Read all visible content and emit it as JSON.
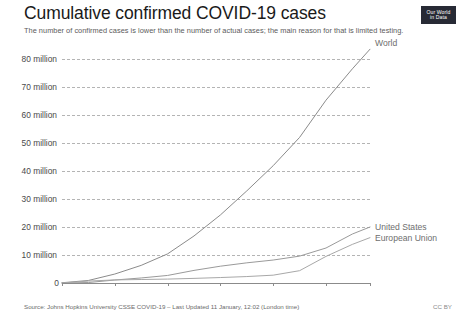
{
  "header": {
    "title": "Cumulative confirmed COVID-19 cases",
    "subtitle": "The number of confirmed cases is lower than the number of actual cases; the main reason for that is limited testing.",
    "logo_line1": "Our World",
    "logo_line2": "in Data"
  },
  "footer": {
    "source": "Source: Johns Hopkins University CSSE COVID-19 – Last Updated 11 January, 12:02  (London time)",
    "license": "CC BY"
  },
  "colors": {
    "world": "#8b8b8b",
    "united_states": "#9a9a9a",
    "european_union": "#a8a8a8",
    "grid": "#b4b4b4",
    "axis": "#8b8b8b",
    "logo_bg": "#272a35"
  },
  "chart_data": {
    "type": "line",
    "title": "Cumulative confirmed COVID-19 cases",
    "subtitle": "The number of confirmed cases is lower than the number of actual cases; the main reason for that is limited testing.",
    "xlabel": "",
    "ylabel": "",
    "grid": true,
    "legend": "inline-right",
    "ylim": [
      0,
      85000000
    ],
    "ytick_values": [
      10000000,
      20000000,
      30000000,
      40000000,
      50000000,
      60000000,
      70000000,
      80000000
    ],
    "ytick_labels": [
      "10 million",
      "20 million",
      "30 million",
      "40 million",
      "50 million",
      "60 million",
      "70 million",
      "80 million"
    ],
    "zero_label": "0",
    "xtick_labels": [
      "Mar 1, 2020",
      "Apr 30",
      "Jun 19",
      "Aug 8",
      "Sep 27",
      "Nov 16",
      "Dec 31, 2020"
    ],
    "xtick_positions": [
      0,
      60,
      120,
      180,
      240,
      300,
      350
    ],
    "xlim": [
      "Mar 1, 2020",
      "Dec 31, 2020"
    ],
    "series": [
      {
        "name": "World",
        "color": "#8b8b8b",
        "x": [
          0,
          30,
          60,
          90,
          120,
          150,
          180,
          210,
          240,
          270,
          300,
          330,
          350
        ],
        "values": [
          88000,
          900000,
          3200000,
          6300000,
          10400000,
          16800000,
          24300000,
          32900000,
          41900000,
          52000000,
          65300000,
          76500000,
          83500000
        ]
      },
      {
        "name": "United States",
        "color": "#9a9a9a",
        "x": [
          0,
          30,
          60,
          90,
          120,
          150,
          180,
          210,
          240,
          270,
          300,
          330,
          350
        ],
        "values": [
          75,
          164000,
          1070000,
          1800000,
          2700000,
          4500000,
          6000000,
          7200000,
          8200000,
          9600000,
          12500000,
          17500000,
          20000000
        ]
      },
      {
        "name": "European Union",
        "color": "#a8a8a8",
        "x": [
          0,
          30,
          60,
          90,
          120,
          150,
          180,
          210,
          240,
          270,
          300,
          330,
          350
        ],
        "values": [
          2100,
          690000,
          1100000,
          1250000,
          1400000,
          1650000,
          1950000,
          2300000,
          2800000,
          4400000,
          9500000,
          13800000,
          16200000
        ]
      }
    ]
  },
  "series_labels": {
    "world": "World",
    "united_states": "United States",
    "european_union": "European Union"
  }
}
